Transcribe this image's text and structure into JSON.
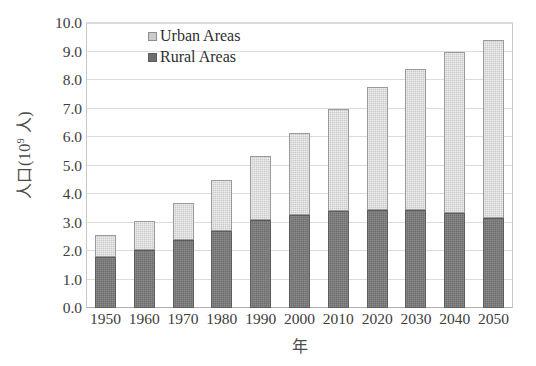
{
  "chart_data": {
    "type": "bar",
    "stacked": true,
    "title": "",
    "xlabel": "年",
    "ylabel": "人口(10⁹ 人)",
    "ylabel_base": "人口(10",
    "ylabel_exp": "9",
    "ylabel_tail": " 人)",
    "categories": [
      "1950",
      "1960",
      "1970",
      "1980",
      "1990",
      "2000",
      "2010",
      "2020",
      "2030",
      "2040",
      "2050"
    ],
    "series": [
      {
        "name": "Rural Areas",
        "color": "#6e6e6e",
        "values": [
          1.8,
          2.05,
          2.4,
          2.7,
          3.1,
          3.25,
          3.4,
          3.45,
          3.45,
          3.35,
          3.15
        ]
      },
      {
        "name": "Urban Areas",
        "color": "#cbcbcb",
        "values": [
          0.75,
          1.0,
          1.3,
          1.8,
          2.25,
          2.9,
          3.6,
          4.3,
          4.95,
          5.65,
          6.25
        ]
      }
    ],
    "totals": [
      2.55,
      3.05,
      3.7,
      4.5,
      5.35,
      6.15,
      7.0,
      7.75,
      8.4,
      9.0,
      9.4
    ],
    "ylim": [
      0.0,
      10.0
    ],
    "ytick_values": [
      0.0,
      1.0,
      2.0,
      3.0,
      4.0,
      5.0,
      6.0,
      7.0,
      8.0,
      9.0,
      10.0
    ],
    "ytick_labels": [
      "0.0",
      "1.0",
      "2.0",
      "3.0",
      "4.0",
      "5.0",
      "6.0",
      "7.0",
      "8.0",
      "9.0",
      "10.0"
    ],
    "grid": true,
    "legend_position": "top-left-inside"
  },
  "legend": {
    "items": [
      {
        "label": "Urban Areas",
        "key": "urban"
      },
      {
        "label": "Rural Areas",
        "key": "rural"
      }
    ]
  },
  "colors": {
    "urban": "#cbcbcb",
    "rural": "#6e6e6e",
    "gridline": "#dcdcdc",
    "axis": "#b0b0b0",
    "text": "#3d3d3d",
    "background": "#ffffff"
  }
}
